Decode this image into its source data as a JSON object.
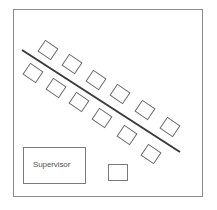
{
  "diagram": {
    "type": "floor-plan",
    "room": {
      "label": ""
    },
    "divider_line": {
      "x1": 22,
      "y1": 50,
      "x2": 180,
      "y2": 152,
      "color": "#3a3a3a"
    },
    "top_row_desks": [
      {
        "cx": 48,
        "cy": 50
      },
      {
        "cx": 72,
        "cy": 64
      },
      {
        "cx": 96,
        "cy": 80
      },
      {
        "cx": 120,
        "cy": 94
      },
      {
        "cx": 145,
        "cy": 110
      },
      {
        "cx": 170,
        "cy": 127
      }
    ],
    "bottom_row_desks": [
      {
        "cx": 33,
        "cy": 73
      },
      {
        "cx": 56,
        "cy": 88
      },
      {
        "cx": 79,
        "cy": 102
      },
      {
        "cx": 102,
        "cy": 118
      },
      {
        "cx": 127,
        "cy": 135
      },
      {
        "cx": 151,
        "cy": 154
      }
    ],
    "supervisor": {
      "label": "Supervisor"
    },
    "small_box": {
      "label": ""
    }
  }
}
